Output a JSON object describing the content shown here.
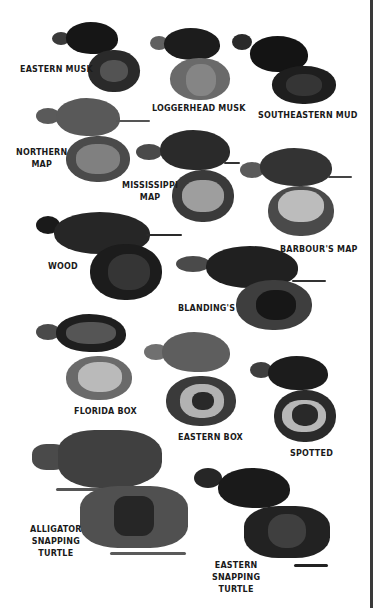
{
  "species": [
    {
      "id": "eastern-musk",
      "label": "EASTERN MUSK"
    },
    {
      "id": "loggerhead-musk",
      "label": "LOGGERHEAD MUSK"
    },
    {
      "id": "southeastern-mud",
      "label": "SOUTHEASTERN MUD"
    },
    {
      "id": "northern-map",
      "label_lines": [
        "NORTHERN",
        "MAP"
      ]
    },
    {
      "id": "mississippi-map",
      "label_lines": [
        "MISSISSIPPI",
        "MAP"
      ]
    },
    {
      "id": "barbours-map",
      "label": "BARBOUR'S MAP"
    },
    {
      "id": "wood",
      "label": "WOOD"
    },
    {
      "id": "blandings",
      "label": "BLANDING'S"
    },
    {
      "id": "florida-box",
      "label": "FLORIDA BOX"
    },
    {
      "id": "eastern-box",
      "label": "EASTERN BOX"
    },
    {
      "id": "spotted",
      "label": "SPOTTED"
    },
    {
      "id": "alligator-snapping",
      "label_lines": [
        "ALLIGATOR",
        "SNAPPING",
        "TURTLE"
      ]
    },
    {
      "id": "eastern-snapping",
      "label_lines": [
        "EASTERN",
        "SNAPPING",
        "TURTLE"
      ]
    }
  ]
}
